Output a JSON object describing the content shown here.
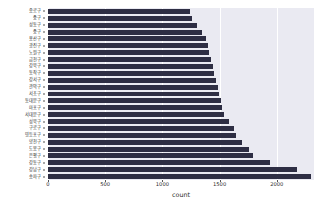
{
  "chart_data": {
    "type": "bar",
    "orientation": "horizontal",
    "title": "",
    "xlabel": "count",
    "ylabel": "",
    "xlim": [
      0,
      2325
    ],
    "xticks": [
      0,
      500,
      1000,
      1500,
      2000
    ],
    "xticklabels": [
      "0",
      "500",
      "1000",
      "1500",
      "2000"
    ],
    "grid": true,
    "grid_axis": "x",
    "legend": "none",
    "bar_color": "#2e2e44",
    "plot_background": "#eaeaf2",
    "gridline_color": "#ffffff",
    "figure_background": "#ffffff",
    "categories": [
      "종로구",
      "중구",
      "성동구",
      "중구",
      "용산구",
      "광진구",
      "노원구",
      "금천구",
      "강북구",
      "동작구",
      "강서구",
      "관악구",
      "서초구",
      "동대문구",
      "마포구",
      "서대문구",
      "성북구",
      "구로구",
      "영등포구",
      "양천구",
      "도봉구",
      "은평구",
      "강동구",
      "강남구",
      "송파구"
    ],
    "values": [
      1240,
      1255,
      1300,
      1345,
      1380,
      1395,
      1410,
      1425,
      1440,
      1455,
      1470,
      1485,
      1495,
      1510,
      1520,
      1535,
      1580,
      1625,
      1640,
      1700,
      1760,
      1790,
      1940,
      2180,
      2300
    ]
  }
}
